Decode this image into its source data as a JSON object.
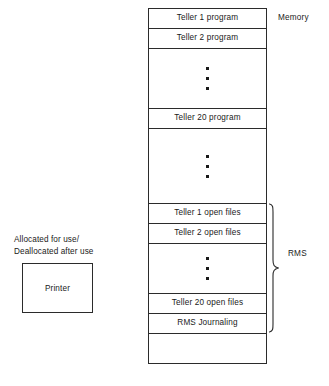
{
  "diagram": {
    "memory_label": "Memory",
    "rms_label": "RMS",
    "memory_rows": [
      {
        "label": "Teller 1 program",
        "kind": "text"
      },
      {
        "label": "Teller 2 program",
        "kind": "text"
      },
      {
        "label": "",
        "kind": "ellipsis"
      },
      {
        "label": "Teller 20 program",
        "kind": "text"
      },
      {
        "label": "",
        "kind": "ellipsis"
      },
      {
        "label": "Teller 1 open files",
        "kind": "text"
      },
      {
        "label": "Teller 2 open files",
        "kind": "text"
      },
      {
        "label": "",
        "kind": "ellipsis"
      },
      {
        "label": "Teller 20 open files",
        "kind": "text"
      },
      {
        "label": "RMS Journaling",
        "kind": "text"
      },
      {
        "label": "",
        "kind": "empty"
      }
    ],
    "printer": {
      "caption_line1": "Allocated for use/",
      "caption_line2": "Deallocated after use",
      "box_label": "Printer"
    },
    "colors": {
      "stroke": "#2b2b2b",
      "text": "#1a1a1a",
      "background": "#ffffff"
    }
  }
}
